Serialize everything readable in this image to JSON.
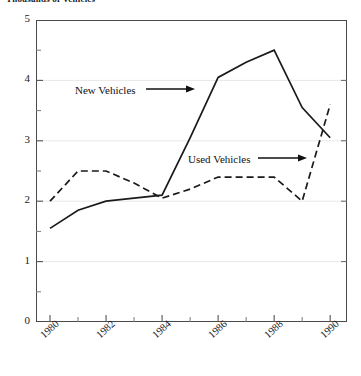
{
  "chart_data": {
    "type": "line",
    "title": "Thousands of Vehicles",
    "xlabel": "",
    "ylabel": "",
    "xlim": [
      1979.5,
      1990.6
    ],
    "ylim": [
      0,
      5
    ],
    "grid": true,
    "grid_values": [
      1,
      2,
      3,
      4
    ],
    "legend_position": "inline-annotations",
    "y_ticks": [
      "5",
      "4",
      "3",
      "2",
      "1",
      "0"
    ],
    "y_tick_values": [
      5,
      4,
      3,
      2,
      1,
      0
    ],
    "y_minor_ticks": [
      0.5,
      1.5,
      2.5,
      3.5,
      4.5
    ],
    "x_ticks": [
      "1980",
      "1982",
      "1984",
      "1986",
      "1988",
      "1990"
    ],
    "x_tick_values": [
      1980,
      1982,
      1984,
      1986,
      1988,
      1990
    ],
    "x_minor_tick_values": [
      1981,
      1983,
      1985,
      1987,
      1989
    ],
    "x": [
      1980,
      1981,
      1982,
      1983,
      1984,
      1985,
      1986,
      1987,
      1988,
      1989,
      1990
    ],
    "series": [
      {
        "name": "New Vehicles",
        "style": "solid",
        "color": "#1a1a1a",
        "values": [
          1.55,
          1.85,
          2.0,
          2.05,
          2.1,
          3.05,
          4.05,
          4.3,
          4.5,
          3.55,
          3.05
        ]
      },
      {
        "name": "Used Vehicles",
        "style": "dashed",
        "color": "#1a1a1a",
        "values": [
          2.0,
          2.5,
          2.5,
          2.3,
          2.05,
          2.2,
          2.4,
          2.4,
          2.4,
          2.0,
          3.6
        ]
      }
    ],
    "annotations": [
      {
        "text": "New Vehicles",
        "target_series": "New Vehicles",
        "arrow": "right"
      },
      {
        "text": "Used Vehicles",
        "target_series": "Used Vehicles",
        "arrow": "right"
      }
    ]
  },
  "axes": {
    "y_labels": [
      "5",
      "4",
      "3",
      "2",
      "1",
      "0"
    ],
    "x_labels": [
      "1980",
      "1982",
      "1984",
      "1986",
      "1988",
      "1990"
    ]
  },
  "annotations": {
    "new_vehicles": "New Vehicles",
    "used_vehicles": "Used Vehicles"
  },
  "colors": {
    "line": "#1a1a1a",
    "frame": "#4a4a4a",
    "grid": "#e8e8e8",
    "background": "#ffffff"
  }
}
